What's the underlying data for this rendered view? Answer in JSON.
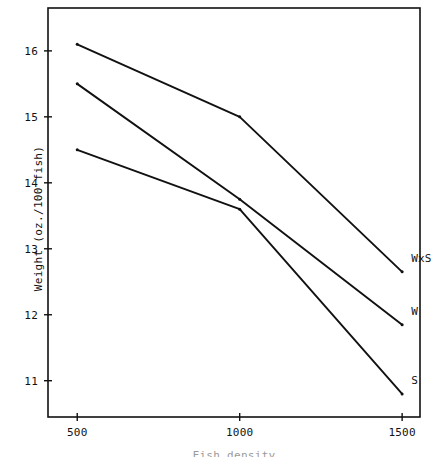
{
  "chart_data": {
    "type": "line",
    "title": "",
    "xlabel": "Fish density",
    "ylabel": "Weight (oz./100 fish)",
    "x": [
      500,
      1000,
      1500
    ],
    "xlim": [
      410,
      1555
    ],
    "ylim": [
      10.45,
      16.65
    ],
    "xticks": [
      500,
      1000,
      1500
    ],
    "xtick_labels": [
      "500",
      "1000",
      "1500"
    ],
    "yticks": [
      11,
      12,
      13,
      14,
      15,
      16
    ],
    "ytick_labels": [
      "11",
      "12",
      "13",
      "14",
      "15",
      "16"
    ],
    "grid": false,
    "legend": "inline-right-of-line-ends",
    "series": [
      {
        "name": "WxS",
        "label": "WxS",
        "values": [
          16.1,
          15.0,
          12.65
        ],
        "color": "#111111"
      },
      {
        "name": "W",
        "label": "W",
        "values": [
          15.5,
          13.75,
          11.85
        ],
        "color": "#111111"
      },
      {
        "name": "S",
        "label": "S",
        "values": [
          14.5,
          13.6,
          10.8
        ],
        "color": "#111111"
      }
    ]
  },
  "axes": {
    "frame_color": "#111111",
    "background": "#ffffff"
  }
}
